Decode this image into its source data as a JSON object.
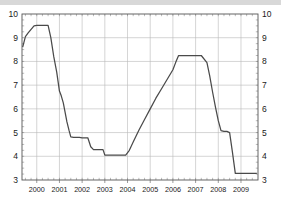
{
  "chart_data": {
    "type": "line",
    "title": "",
    "subtitle": "",
    "xlabel": "",
    "ylabel": "",
    "xlim": [
      1999.35,
      2009.75
    ],
    "ylim": [
      3,
      10
    ],
    "grid": true,
    "legend_position": "none",
    "dual_y_axis": true,
    "y_ticks": [
      3,
      4,
      5,
      6,
      7,
      8,
      9,
      10
    ],
    "y_ticklabels_left": [
      "3",
      "4",
      "5",
      "6",
      "7",
      "8",
      "9",
      "10"
    ],
    "y_ticklabels_right": [
      "3",
      "4",
      "5",
      "6",
      "7",
      "8",
      "9",
      "10"
    ],
    "x_ticks": [
      2000,
      2001,
      2002,
      2003,
      2004,
      2005,
      2006,
      2007,
      2008,
      2009
    ],
    "x_ticklabels": [
      "2000",
      "2001",
      "2002",
      "2003",
      "2004",
      "2005",
      "2006",
      "2007",
      "2008",
      "2009"
    ],
    "x_minor_ticks_per_interval": 4,
    "series": [
      {
        "name": "rate",
        "color": "#4a4a4a",
        "x": [
          1999.38,
          1999.5,
          1999.62,
          1999.75,
          1999.88,
          2000.0,
          2000.12,
          2000.25,
          2000.38,
          2000.5,
          2000.62,
          2000.75,
          2000.88,
          2001.0,
          2001.08,
          2001.17,
          2001.25,
          2001.33,
          2001.42,
          2001.5,
          2001.62,
          2001.75,
          2001.88,
          2002.0,
          2002.25,
          2002.38,
          2002.5,
          2002.75,
          2002.92,
          2003.0,
          2003.25,
          2003.5,
          2003.75,
          2003.92,
          2004.08,
          2004.25,
          2004.5,
          2004.75,
          2005.0,
          2005.25,
          2005.5,
          2005.75,
          2006.0,
          2006.12,
          2006.25,
          2006.5,
          2006.75,
          2007.0,
          2007.12,
          2007.25,
          2007.5,
          2007.62,
          2007.75,
          2007.88,
          2008.0,
          2008.12,
          2008.25,
          2008.38,
          2008.5,
          2008.62,
          2008.75,
          2009.0,
          2009.25,
          2009.5,
          2009.7
        ],
        "y": [
          8.6,
          9.05,
          9.2,
          9.35,
          9.5,
          9.52,
          9.52,
          9.52,
          9.52,
          9.52,
          9.0,
          8.2,
          7.55,
          6.75,
          6.55,
          6.25,
          5.85,
          5.45,
          5.1,
          4.82,
          4.8,
          4.8,
          4.8,
          4.78,
          4.78,
          4.4,
          4.28,
          4.28,
          4.28,
          4.05,
          4.05,
          4.05,
          4.05,
          4.05,
          4.25,
          4.6,
          5.1,
          5.55,
          6.0,
          6.45,
          6.85,
          7.25,
          7.65,
          7.95,
          8.25,
          8.25,
          8.25,
          8.25,
          8.25,
          8.25,
          7.95,
          7.4,
          6.7,
          6.05,
          5.5,
          5.08,
          5.05,
          5.05,
          5.0,
          4.2,
          3.28,
          3.28,
          3.28,
          3.28,
          3.28
        ]
      }
    ]
  },
  "axes": {
    "left_axis_name": "left-value-axis",
    "right_axis_name": "right-value-axis",
    "bottom_axis_name": "year-axis"
  }
}
